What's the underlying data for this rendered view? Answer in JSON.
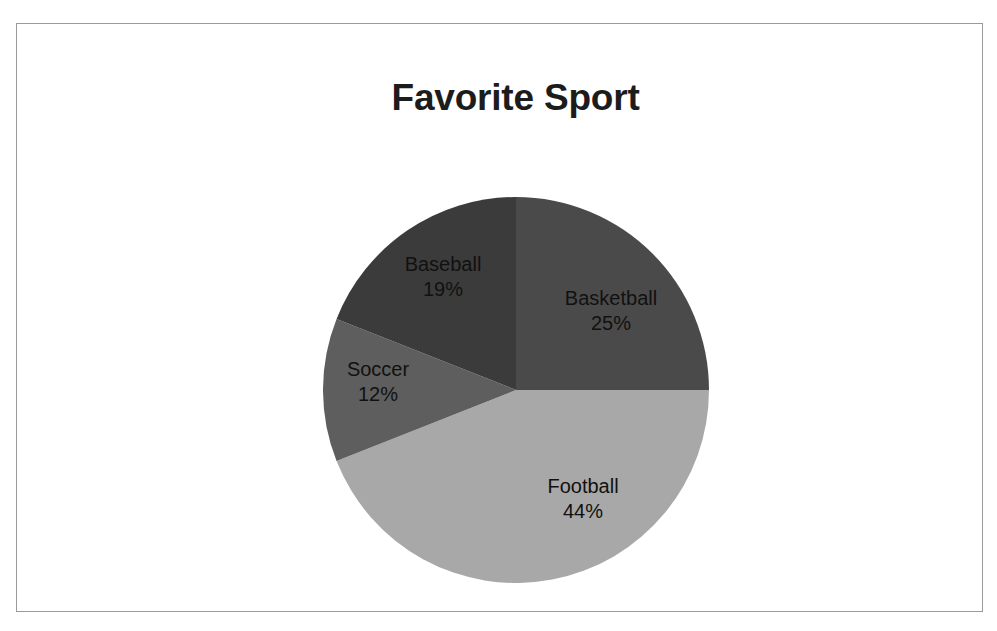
{
  "chart_data": {
    "type": "pie",
    "title": "Favorite Sport",
    "categories": [
      "Basketball",
      "Football",
      "Soccer",
      "Baseball"
    ],
    "values": [
      25,
      44,
      12,
      19
    ],
    "unit": "%",
    "labels": [
      {
        "name": "Basketball",
        "value": 25,
        "value_label": "25%",
        "color": "#4a4a4a",
        "start_angle_deg": 0,
        "end_angle_deg": 90
      },
      {
        "name": "Football",
        "value": 44,
        "value_label": "44%",
        "color": "#a8a8a8",
        "start_angle_deg": 90,
        "end_angle_deg": 248.4
      },
      {
        "name": "Soccer",
        "value": 12,
        "value_label": "12%",
        "color": "#5e5e5e",
        "start_angle_deg": 248.4,
        "end_angle_deg": 291.6
      },
      {
        "name": "Baseball",
        "value": 19,
        "value_label": "19%",
        "color": "#3b3b3b",
        "start_angle_deg": 291.6,
        "end_angle_deg": 360
      }
    ],
    "legend": "none",
    "data_labels": "inside-slice (name + percentage)",
    "grid": false,
    "total": 100,
    "start_angle_note": "first slice begins at 12 o'clock, drawn clockwise"
  },
  "frame": {
    "border_color": "#9a9a9a",
    "background": "#ffffff"
  },
  "title_style": {
    "color": "#1c1c1c"
  }
}
